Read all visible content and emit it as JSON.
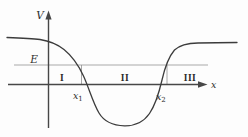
{
  "figure": {
    "name": "potential-well-energy-diagram",
    "axis_labels": {
      "vertical": "V",
      "horizontal": "x"
    },
    "energy_label": "E",
    "regions": [
      {
        "label": "I"
      },
      {
        "label": "II"
      },
      {
        "label": "III"
      }
    ],
    "points": [
      {
        "base": "x",
        "sub": "1"
      },
      {
        "base": "x",
        "sub": "2"
      }
    ],
    "colors": {
      "background": "#fdfdfd",
      "curve": "#3c3c3c",
      "axis": "#474747",
      "energy_line": "#a9a9a9",
      "marker_line": "#8f8f8f",
      "text": "#2e2e2e"
    }
  }
}
